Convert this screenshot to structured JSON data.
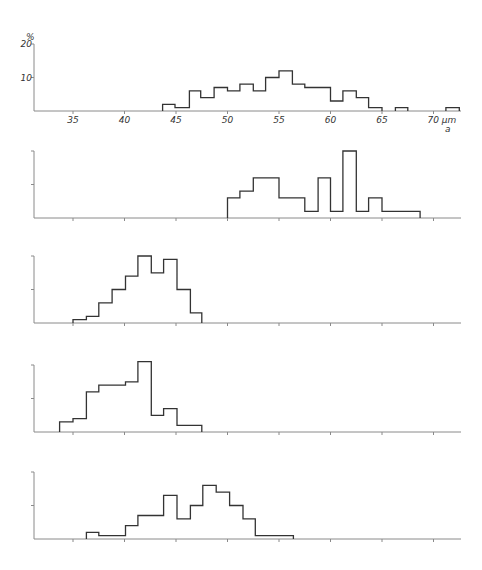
{
  "figure": {
    "y_unit_label": "%",
    "x_unit_label": "70 µm",
    "panel_label": "a",
    "y_ticks": [
      {
        "value": 20,
        "label": "20"
      },
      {
        "value": 10,
        "label": "10"
      }
    ],
    "x_ticks": [
      35,
      40,
      45,
      50,
      55,
      60,
      65,
      70
    ],
    "x_tick_labels": [
      "35",
      "40",
      "45",
      "50",
      "55",
      "60",
      "65",
      "70 µm"
    ]
  },
  "chart_data": [
    {
      "type": "bar",
      "title": "",
      "panel": 1,
      "xlabel": "µm",
      "ylabel": "%",
      "xlim": [
        31,
        73
      ],
      "ylim": [
        0,
        20
      ],
      "bins": [
        [
          43.7,
          44.9,
          2
        ],
        [
          44.9,
          46.3,
          1
        ],
        [
          46.3,
          47.4,
          6
        ],
        [
          47.4,
          48.7,
          4
        ],
        [
          48.7,
          50.0,
          7
        ],
        [
          50.0,
          51.2,
          6
        ],
        [
          51.2,
          52.5,
          8
        ],
        [
          52.5,
          53.7,
          6
        ],
        [
          53.7,
          55.0,
          10
        ],
        [
          55.0,
          56.3,
          12
        ],
        [
          56.3,
          57.5,
          8
        ],
        [
          57.5,
          60.0,
          7
        ],
        [
          60.0,
          61.2,
          3
        ],
        [
          61.2,
          62.5,
          6
        ],
        [
          62.5,
          63.7,
          4
        ],
        [
          63.7,
          65.0,
          1
        ],
        [
          66.3,
          67.5,
          1
        ],
        [
          71.2,
          72.5,
          1
        ]
      ]
    },
    {
      "type": "bar",
      "panel": 2,
      "xlim": [
        31,
        73
      ],
      "ylim": [
        0,
        20
      ],
      "bins": [
        [
          50.0,
          51.2,
          6
        ],
        [
          51.2,
          52.5,
          8
        ],
        [
          52.5,
          55.0,
          12
        ],
        [
          55.0,
          57.5,
          6
        ],
        [
          57.5,
          58.8,
          2
        ],
        [
          58.8,
          60.0,
          12
        ],
        [
          60.0,
          61.2,
          2
        ],
        [
          61.2,
          62.5,
          20
        ],
        [
          62.5,
          63.7,
          2
        ],
        [
          63.7,
          65.0,
          6
        ],
        [
          65.0,
          68.7,
          2
        ]
      ]
    },
    {
      "type": "bar",
      "panel": 3,
      "xlim": [
        31,
        73
      ],
      "ylim": [
        0,
        20
      ],
      "bins": [
        [
          35.0,
          36.3,
          1
        ],
        [
          36.3,
          37.5,
          2
        ],
        [
          37.5,
          38.8,
          6
        ],
        [
          38.8,
          40.1,
          10
        ],
        [
          40.1,
          41.3,
          14
        ],
        [
          41.3,
          42.6,
          20
        ],
        [
          42.6,
          43.8,
          15
        ],
        [
          43.8,
          45.1,
          19
        ],
        [
          45.1,
          46.4,
          10
        ],
        [
          46.4,
          47.5,
          3
        ]
      ]
    },
    {
      "type": "bar",
      "panel": 4,
      "xlim": [
        31,
        73
      ],
      "ylim": [
        0,
        20
      ],
      "bins": [
        [
          33.7,
          35.0,
          3
        ],
        [
          35.0,
          36.3,
          4
        ],
        [
          36.3,
          37.5,
          12
        ],
        [
          37.5,
          40.1,
          14
        ],
        [
          40.1,
          41.3,
          15
        ],
        [
          41.3,
          42.6,
          21
        ],
        [
          42.6,
          43.8,
          5
        ],
        [
          43.8,
          45.1,
          7
        ],
        [
          45.1,
          47.5,
          2
        ]
      ]
    },
    {
      "type": "bar",
      "panel": 5,
      "xlim": [
        31,
        73
      ],
      "ylim": [
        0,
        20
      ],
      "bins": [
        [
          36.3,
          37.5,
          2
        ],
        [
          37.5,
          40.1,
          1
        ],
        [
          40.1,
          41.3,
          4
        ],
        [
          41.3,
          43.8,
          7
        ],
        [
          43.8,
          45.1,
          13
        ],
        [
          45.1,
          46.4,
          6
        ],
        [
          46.4,
          47.6,
          10
        ],
        [
          47.6,
          48.9,
          16
        ],
        [
          48.9,
          50.2,
          14
        ],
        [
          50.2,
          51.5,
          10
        ],
        [
          51.5,
          52.7,
          6
        ],
        [
          52.7,
          56.4,
          1
        ]
      ]
    }
  ]
}
